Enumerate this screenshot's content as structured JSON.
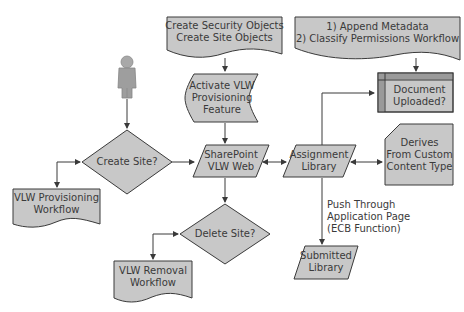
{
  "colors": {
    "shape_fill": "#c8c8c8",
    "shape_stroke": "#3a3a3a",
    "internal_storage_band": "#9a9a9a",
    "text": "#3a3a3a",
    "background": "#ffffff",
    "actor": "#9e9e9e"
  },
  "nodes": {
    "actor": {
      "icon": "person-icon"
    },
    "create_site": {
      "type": "decision",
      "lines": [
        "Create Site?"
      ]
    },
    "vlw_provisioning_workflow": {
      "type": "document",
      "lines": [
        "VLW Provisioning",
        "Workflow"
      ]
    },
    "create_objects": {
      "type": "document",
      "lines": [
        "Create Security Objects",
        "Create Site Objects"
      ]
    },
    "activate_feature": {
      "type": "stored-data",
      "lines": [
        "Activate VLW",
        "Provisioning",
        "Feature"
      ]
    },
    "sharepoint_web": {
      "type": "data",
      "lines": [
        "SharePoint",
        "VLW Web"
      ]
    },
    "delete_site": {
      "type": "decision",
      "lines": [
        "Delete Site?"
      ]
    },
    "vlw_removal_workflow": {
      "type": "document",
      "lines": [
        "VLW Removal",
        "Workflow"
      ]
    },
    "assignment_library": {
      "type": "data",
      "lines": [
        "Assignment",
        "Library"
      ]
    },
    "metadata_workflow": {
      "type": "document",
      "lines": [
        "1) Append Metadata",
        "2) Classify Permissions Workflow"
      ]
    },
    "document_uploaded": {
      "type": "internal-storage",
      "lines": [
        "Document",
        "Uploaded?"
      ]
    },
    "custom_content_type": {
      "type": "card",
      "lines": [
        "Derives",
        "From Custom",
        "Content Type"
      ]
    },
    "submitted_library": {
      "type": "data",
      "lines": [
        "Submitted",
        "Library"
      ]
    }
  },
  "edge_labels": {
    "push_through": [
      "Push Through",
      "Application Page",
      "(ECB Function)"
    ]
  }
}
